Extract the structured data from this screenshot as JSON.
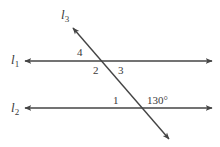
{
  "diagram": {
    "lines": {
      "l1": {
        "name": "l",
        "sub": "1"
      },
      "l2": {
        "name": "l",
        "sub": "2"
      },
      "l3": {
        "name": "l",
        "sub": "3"
      }
    },
    "angles": {
      "a4": "4",
      "a2": "2",
      "a3": "3",
      "a1": "1",
      "given": "130°"
    },
    "colors": {
      "line": "#444444",
      "text": "#3a3a3a"
    }
  }
}
